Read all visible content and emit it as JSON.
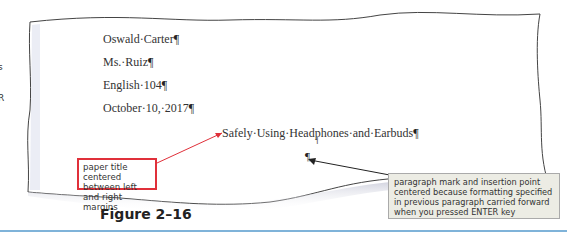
{
  "document": {
    "lines": [
      {
        "text": "Oswald·Carter",
        "mark": "¶"
      },
      {
        "text": "Ms.·Ruiz",
        "mark": "¶"
      },
      {
        "text": "English·104",
        "mark": "¶"
      },
      {
        "text": "October·10,·2017",
        "mark": "¶"
      }
    ],
    "title": {
      "text": "Safely·Using·Headphones·and·Earbuds",
      "mark": "¶"
    },
    "empty_paragraph_mark": "¶",
    "ibeam": "I"
  },
  "edge_fragments": [
    "s",
    "R"
  ],
  "callouts": {
    "title_note": "paper title centered between left and right margins",
    "paragraph_note": "paragraph mark and insertion point centered because formatting specified in previous paragraph carried forward when you pressed ENTER key"
  },
  "figure": {
    "label": "Figure 2–16"
  },
  "colors": {
    "callout_red": "#e0303a",
    "callout_gray_bg": "#ecece4",
    "rule_blue": "#7fb3d9"
  }
}
